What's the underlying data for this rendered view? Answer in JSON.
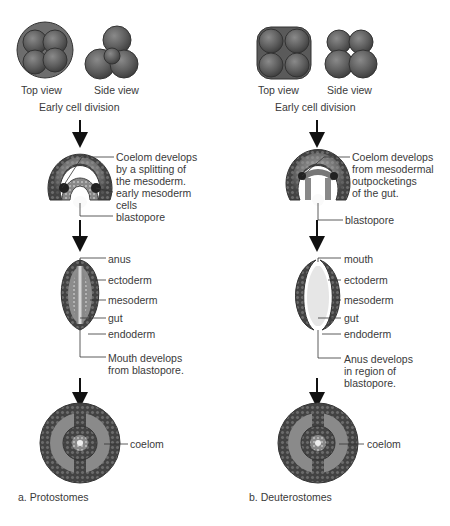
{
  "diagram": {
    "type": "developmental-comparison",
    "columns": [
      {
        "id": "protostomes",
        "title": "a. Protostomes",
        "stage1": {
          "top_view": "Top view",
          "side_view": "Side view",
          "caption": "Early cell division"
        },
        "stage2": {
          "labels": [
            "Coelom develops\nby a splitting of\nthe mesoderm.",
            "early mesoderm\ncells",
            "blastopore"
          ]
        },
        "stage3": {
          "labels": [
            "anus",
            "ectoderm",
            "mesoderm",
            "gut",
            "endoderm",
            "Mouth develops\nfrom blastopore."
          ]
        },
        "stage4": {
          "labels": [
            "coelom"
          ]
        }
      },
      {
        "id": "deuterostomes",
        "title": "b. Deuterostomes",
        "stage1": {
          "top_view": "Top view",
          "side_view": "Side view",
          "caption": "Early cell division"
        },
        "stage2": {
          "labels": [
            "Coelom develops\nfrom mesodermal\noutpocketings\nof the gut.",
            "blastopore"
          ]
        },
        "stage3": {
          "labels": [
            "mouth",
            "ectoderm",
            "mesoderm",
            "gut",
            "endoderm",
            "Anus develops\nin region of\nblastopore."
          ]
        },
        "stage4": {
          "labels": [
            "coelom"
          ]
        }
      }
    ],
    "colors": {
      "cell": "#5f5f5f",
      "cell_dark": "#3a3a3a",
      "leader_line": "#333333",
      "text": "#3a3a3a"
    }
  }
}
